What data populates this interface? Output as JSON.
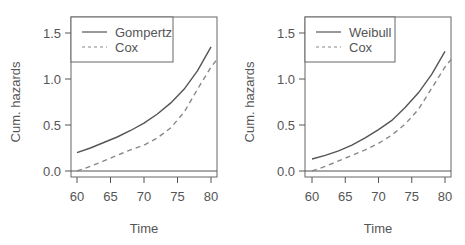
{
  "chart_data": [
    {
      "type": "line",
      "title": "",
      "xlabel": "Time",
      "ylabel": "Cum. hazards",
      "xlim": [
        59,
        81
      ],
      "ylim": [
        -0.05,
        1.65
      ],
      "xticks": [
        "60",
        "65",
        "70",
        "75",
        "80"
      ],
      "yticks": [
        "0.0",
        "0.5",
        "1.0",
        "1.5"
      ],
      "grid": false,
      "legend_position": "top-left",
      "hline": 0.0,
      "x": [
        60,
        62,
        64,
        66,
        68,
        70,
        72,
        74,
        76,
        78,
        80,
        81
      ],
      "series": [
        {
          "name": "Gompertz",
          "style": "solid",
          "color": "#555555",
          "values": [
            0.2,
            0.25,
            0.31,
            0.37,
            0.44,
            0.52,
            0.62,
            0.74,
            0.89,
            1.09,
            1.35,
            null
          ]
        },
        {
          "name": "Cox",
          "style": "dashed",
          "color": "#888888",
          "values": [
            0.0,
            0.05,
            0.11,
            0.17,
            0.23,
            0.28,
            0.36,
            0.47,
            0.64,
            0.89,
            1.13,
            1.22
          ]
        }
      ]
    },
    {
      "type": "line",
      "title": "",
      "xlabel": "Time",
      "ylabel": "Cum. hazards",
      "xlim": [
        59,
        81
      ],
      "ylim": [
        -0.05,
        1.65
      ],
      "xticks": [
        "60",
        "65",
        "70",
        "75",
        "80"
      ],
      "yticks": [
        "0.0",
        "0.5",
        "1.0",
        "1.5"
      ],
      "grid": false,
      "legend_position": "top-left",
      "hline": 0.0,
      "x": [
        60,
        62,
        64,
        66,
        68,
        70,
        72,
        74,
        76,
        78,
        80,
        81
      ],
      "series": [
        {
          "name": "Weibull",
          "style": "solid",
          "color": "#555555",
          "values": [
            0.13,
            0.17,
            0.22,
            0.28,
            0.36,
            0.45,
            0.55,
            0.69,
            0.85,
            1.05,
            1.3,
            null
          ]
        },
        {
          "name": "Cox",
          "style": "dashed",
          "color": "#888888",
          "values": [
            0.0,
            0.05,
            0.11,
            0.17,
            0.23,
            0.3,
            0.39,
            0.51,
            0.67,
            0.9,
            1.13,
            1.22
          ]
        }
      ]
    }
  ]
}
